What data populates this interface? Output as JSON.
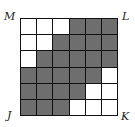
{
  "figure": {
    "rows": 6,
    "cols": 6,
    "colors": {
      "shaded": "#6e6e6e",
      "unshaded": "#ffffff",
      "lines": "#111111"
    },
    "cells": [
      [
        0,
        0,
        0,
        1,
        1,
        1
      ],
      [
        0,
        0,
        1,
        1,
        1,
        1
      ],
      [
        0,
        1,
        1,
        1,
        1,
        1
      ],
      [
        1,
        1,
        1,
        1,
        1,
        0
      ],
      [
        1,
        1,
        1,
        1,
        0,
        0
      ],
      [
        1,
        1,
        1,
        0,
        0,
        0
      ]
    ],
    "shaded_count": 24,
    "total_cells": 36
  },
  "labels": {
    "top_left": "M",
    "top_right": "L",
    "bottom_left": "J",
    "bottom_right": "K"
  }
}
